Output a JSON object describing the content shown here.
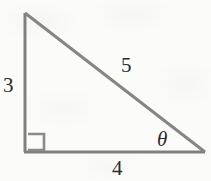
{
  "figure": {
    "kind": "right-triangle-diagram",
    "width": 211,
    "height": 181,
    "background_color": "#fbfbfa",
    "stroke_color": "#808080",
    "stroke_width": 3,
    "label_color": "#2b2b2b"
  },
  "geometry": {
    "vertices": {
      "apex_top_left": {
        "x": 25,
        "y": 13
      },
      "right_angle_bottom_left": {
        "x": 25,
        "y": 152
      },
      "angle_theta_bottom_right": {
        "x": 205,
        "y": 152
      }
    },
    "right_angle_marker": {
      "x": 28,
      "y": 134,
      "size": 16
    }
  },
  "labels": {
    "vertical_leg": "3",
    "hypotenuse": "5",
    "horizontal_leg": "4",
    "angle": "θ"
  },
  "label_names": {
    "vertical_leg": "side-length-label-3",
    "hypotenuse": "side-length-label-5",
    "horizontal_leg": "side-length-label-4",
    "angle": "angle-label-theta"
  }
}
